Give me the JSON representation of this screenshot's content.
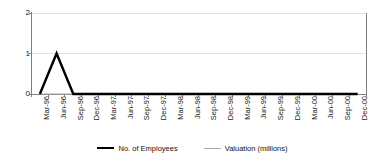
{
  "chart_data": {
    "type": "line",
    "title": "",
    "subtitle": "",
    "xlabel": "",
    "ylabel": "",
    "ylim": [
      0,
      2
    ],
    "yticks": [
      "0",
      "1",
      "2"
    ],
    "grid": true,
    "legend_position": "bottom",
    "categories": [
      "Mar-96",
      "Jun-96",
      "Sep-96",
      "Dec-96",
      "Mar-97",
      "Jun-97",
      "Sep-97",
      "Dec-97",
      "Mar-98",
      "Jun-98",
      "Sep-98",
      "Dec-98",
      "Mar-99",
      "Jun-99",
      "Sep-99",
      "Dec-99",
      "Mar-00",
      "Jun-00",
      "Sep-00",
      "Dec-00"
    ],
    "series": [
      {
        "name": "No. of Employees",
        "color": "#000000",
        "width": 2.4,
        "values": [
          0,
          1,
          0,
          0,
          0,
          0,
          0,
          0,
          0,
          0,
          0,
          0,
          0,
          0,
          0,
          0,
          0,
          0,
          0,
          0
        ]
      },
      {
        "name": "Valuation (millions)",
        "color": "#a8a8a8",
        "width": 1.2,
        "values": [
          0,
          0,
          0,
          0,
          0,
          0,
          0,
          0,
          0,
          0,
          0,
          0,
          0,
          0,
          0,
          0,
          0,
          0,
          0,
          0
        ]
      }
    ]
  },
  "axes": {
    "axis_color": "#808080",
    "grid_color": "#e0e0e0",
    "tick_color": "#808080",
    "background": "#ffffff"
  },
  "legend": {
    "entries": [
      {
        "label": "No. of Employees",
        "swatch": "thick-black-line"
      },
      {
        "label": "Valuation (millions)",
        "swatch": "thin-gray-line"
      }
    ]
  }
}
